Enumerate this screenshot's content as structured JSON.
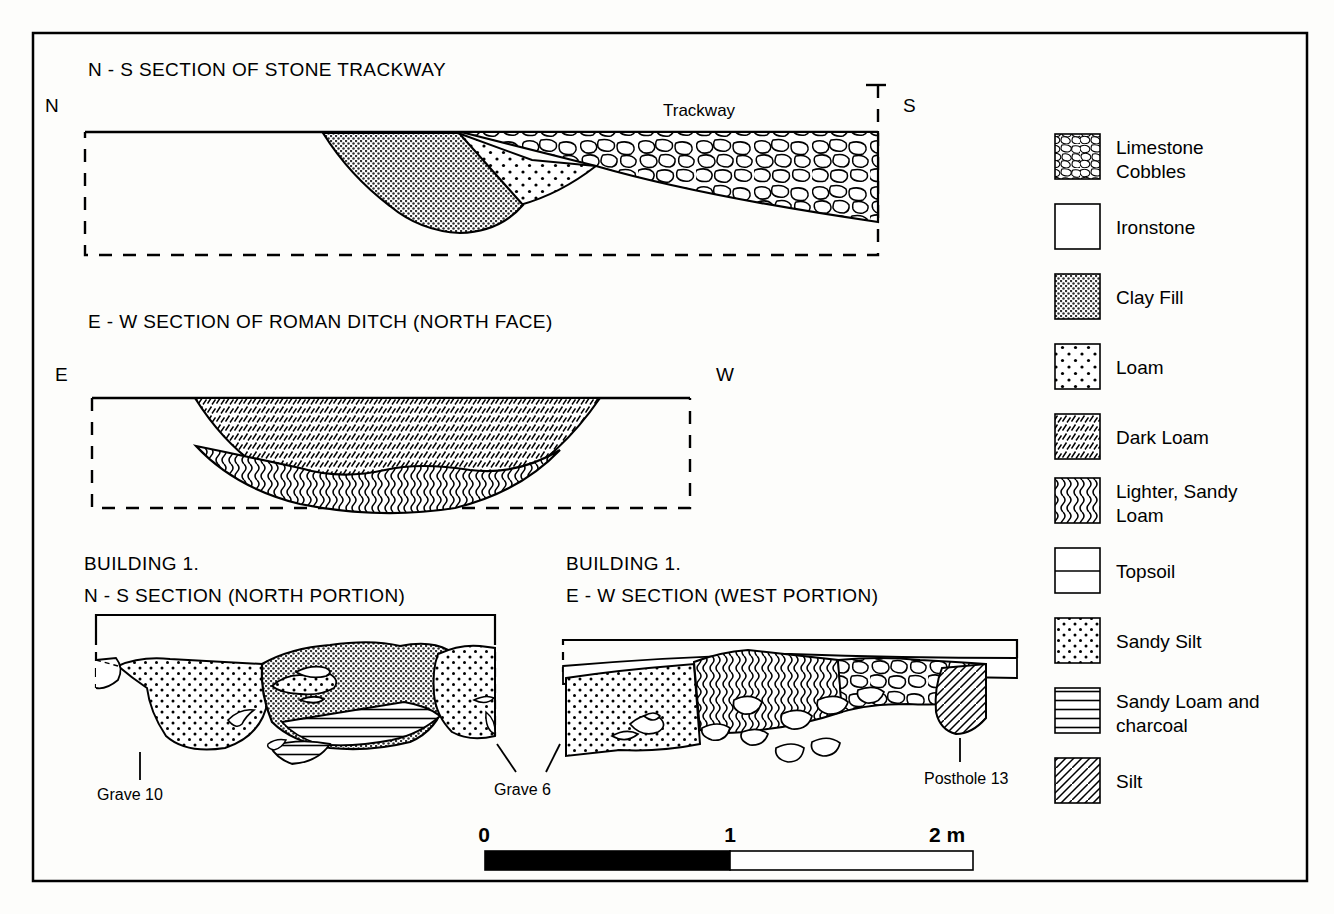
{
  "figure": {
    "title_block": {
      "trackway_section_title": "N - S SECTION OF STONE TRACKWAY",
      "ditch_section_title": "E - W SECTION OF ROMAN DITCH (NORTH FACE)",
      "building_ns_title_line1": "BUILDING 1.",
      "building_ns_title_line2": "N - S SECTION (NORTH PORTION)",
      "building_ew_title_line1": "BUILDING 1.",
      "building_ew_title_line2": "E - W SECTION (WEST PORTION)"
    },
    "compass_labels": {
      "trackway_left": "N",
      "trackway_right": "S",
      "ditch_left": "E",
      "ditch_right": "W"
    },
    "feature_labels": {
      "trackway": "Trackway",
      "grave_10": "Grave 10",
      "grave_6": "Grave 6",
      "posthole_13": "Posthole 13"
    },
    "scale_bar": {
      "ticks": [
        "0",
        "1",
        "2 m"
      ],
      "filled_segment_value": 1,
      "total_value": 2,
      "unit": "m"
    },
    "legend": {
      "items": [
        {
          "label": "Limestone Cobbles",
          "lines": [
            "Limestone",
            "Cobbles"
          ],
          "pattern": "cobbles"
        },
        {
          "label": "Ironstone",
          "lines": [
            "Ironstone"
          ],
          "pattern": "blank"
        },
        {
          "label": "Clay Fill",
          "lines": [
            "Clay Fill"
          ],
          "pattern": "clay"
        },
        {
          "label": "Loam",
          "lines": [
            "Loam"
          ],
          "pattern": "loam"
        },
        {
          "label": "Dark Loam",
          "lines": [
            "Dark Loam"
          ],
          "pattern": "darkloam"
        },
        {
          "label": "Lighter, Sandy Loam",
          "lines": [
            "Lighter, Sandy",
            "Loam"
          ],
          "pattern": "sandyloam"
        },
        {
          "label": "Topsoil",
          "lines": [
            "Topsoil"
          ],
          "pattern": "topsoil"
        },
        {
          "label": "Sandy Silt",
          "lines": [
            "Sandy Silt"
          ],
          "pattern": "sandysilt"
        },
        {
          "label": "Sandy Loam and charcoal",
          "lines": [
            "Sandy Loam and",
            "charcoal"
          ],
          "pattern": "charcoal"
        },
        {
          "label": "Silt",
          "lines": [
            "Silt"
          ],
          "pattern": "silt"
        }
      ]
    },
    "colors": {
      "ink": "#000000",
      "paper": "#fdfdfb",
      "clay_fill": "#6f6f6f",
      "scale_fill": "#000000"
    }
  }
}
